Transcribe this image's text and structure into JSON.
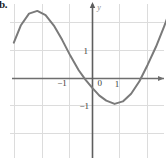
{
  "figure": {
    "label": "b.",
    "background_color": "#ffffff",
    "grid_color": "#d9d9d9",
    "axis_color": "#6e6e6e",
    "curve_color": "#7a7a7a",
    "tick_label_color": "#3a3a3a"
  },
  "chart_data": {
    "type": "line",
    "title": "",
    "xlabel": "",
    "ylabel": "y",
    "xlim": [
      -2.9,
      2.7
    ],
    "ylim": [
      -2.85,
      2.85
    ],
    "grid": true,
    "grid_step": 1,
    "legend": false,
    "x_tick_labels": [
      "-1",
      "0",
      "1"
    ],
    "x_tick_values": [
      -1,
      0,
      1
    ],
    "y_tick_labels": [
      "1",
      "-1"
    ],
    "y_tick_values": [
      1,
      -1
    ],
    "axis_arrows": [
      "x-right",
      "y-top"
    ],
    "series": [
      {
        "name": "curve",
        "x": [
          -2.85,
          -2.6,
          -2.3,
          -2.0,
          -1.7,
          -1.4,
          -1.1,
          -0.8,
          -0.5,
          -0.25,
          0.0,
          0.25,
          0.5,
          0.8,
          1.1,
          1.4,
          1.7,
          2.0,
          2.3,
          2.6,
          2.75
        ],
        "y": [
          1.3,
          1.92,
          2.35,
          2.45,
          2.3,
          1.92,
          1.4,
          0.82,
          0.3,
          -0.05,
          -0.35,
          -0.62,
          -0.8,
          -0.92,
          -0.83,
          -0.55,
          -0.1,
          0.5,
          1.15,
          1.9,
          2.3
        ]
      }
    ],
    "features": {
      "local_maximum": {
        "x": -2.0,
        "y": 2.45
      },
      "local_minimum": {
        "x": 0.92,
        "y": -0.93
      },
      "x_intercepts": [
        -0.18,
        1.78
      ]
    }
  }
}
